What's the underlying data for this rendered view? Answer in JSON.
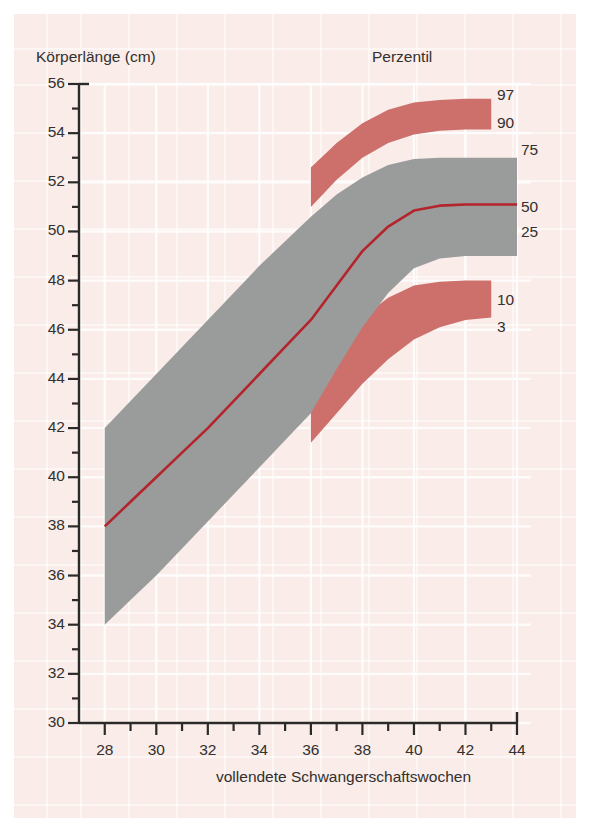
{
  "figure": {
    "y_axis_title": "Körperlänge (cm)",
    "x_axis_title": "vollendete Schwangerschaftswochen",
    "legend_title": "Perzentil",
    "background_color": "#f9ece9",
    "band_outer_color": "#cd6f6b",
    "band_inner_color": "#9a9c9c",
    "median_color": "#b4242c",
    "axis_color": "#2c2a29",
    "grid_color": "#ffffff"
  },
  "chart_data": {
    "type": "area",
    "title": "",
    "subtitle": "",
    "xlabel": "vollendete Schwangerschaftswochen",
    "ylabel": "Körperlänge (cm)",
    "xlim": [
      27,
      44
    ],
    "ylim": [
      30,
      56
    ],
    "xticks": [
      28,
      30,
      32,
      34,
      36,
      38,
      40,
      42,
      44
    ],
    "yticks": [
      30,
      32,
      34,
      36,
      38,
      40,
      42,
      44,
      46,
      48,
      50,
      52,
      54,
      56
    ],
    "xtick_minor_step": 1,
    "ytick_minor_step": 1,
    "grid": true,
    "legend_position": "right",
    "legend_title": "Perzentil",
    "legend_entries": [
      "97",
      "90",
      "75",
      "50",
      "25",
      "10",
      "3"
    ],
    "x": [
      28,
      29,
      30,
      31,
      32,
      33,
      34,
      35,
      36,
      37,
      38,
      39,
      40,
      41,
      42,
      43,
      44
    ],
    "series": [
      {
        "name": "97",
        "label": "97",
        "color": "#cd6f6b",
        "values": [
          null,
          null,
          null,
          null,
          null,
          null,
          null,
          null,
          52.6,
          53.6,
          54.4,
          54.95,
          55.25,
          55.35,
          55.4,
          55.4,
          null
        ]
      },
      {
        "name": "90",
        "label": "90",
        "color": "#cd6f6b",
        "values": [
          null,
          null,
          null,
          null,
          null,
          null,
          null,
          null,
          51.0,
          52.1,
          53.0,
          53.6,
          53.95,
          54.1,
          54.15,
          54.15,
          null
        ]
      },
      {
        "name": "75",
        "label": "75",
        "color": "#9a9c9c",
        "values": [
          42.0,
          43.1,
          44.2,
          45.3,
          46.4,
          47.5,
          48.6,
          49.6,
          50.6,
          51.5,
          52.2,
          52.7,
          52.95,
          53.0,
          53.0,
          53.0,
          53.0
        ]
      },
      {
        "name": "50",
        "label": "50",
        "color": "#b4242c",
        "values": [
          38.0,
          39.0,
          40.0,
          41.0,
          42.0,
          43.1,
          44.2,
          45.3,
          46.4,
          47.8,
          49.2,
          50.2,
          50.85,
          51.05,
          51.1,
          51.1,
          51.1
        ]
      },
      {
        "name": "25",
        "label": "25",
        "color": "#9a9c9c",
        "values": [
          34.0,
          35.0,
          36.0,
          37.1,
          38.2,
          39.3,
          40.4,
          41.5,
          42.6,
          44.4,
          46.1,
          47.5,
          48.5,
          48.9,
          49.0,
          49.0,
          49.0
        ]
      },
      {
        "name": "10",
        "label": "10",
        "color": "#cd6f6b",
        "values": [
          null,
          null,
          null,
          null,
          null,
          null,
          null,
          null,
          44.6,
          45.6,
          46.5,
          47.3,
          47.8,
          47.95,
          48.0,
          48.0,
          null
        ]
      },
      {
        "name": "3",
        "label": "3",
        "color": "#cd6f6b",
        "values": [
          null,
          null,
          null,
          null,
          null,
          null,
          null,
          null,
          41.4,
          42.6,
          43.8,
          44.8,
          45.6,
          46.1,
          46.4,
          46.5,
          null
        ]
      }
    ],
    "annotations": [
      {
        "text": "Perzentil",
        "role": "legend-title"
      },
      {
        "text": "97",
        "role": "percentile-label"
      },
      {
        "text": "90",
        "role": "percentile-label"
      },
      {
        "text": "75",
        "role": "percentile-label"
      },
      {
        "text": "50",
        "role": "percentile-label"
      },
      {
        "text": "25",
        "role": "percentile-label"
      },
      {
        "text": "10",
        "role": "percentile-label"
      },
      {
        "text": "3",
        "role": "percentile-label"
      }
    ]
  },
  "labels": {
    "percentiles": [
      {
        "text": "97",
        "x": 497,
        "y": 86
      },
      {
        "text": "90",
        "x": 497,
        "y": 114
      },
      {
        "text": "75",
        "x": 521,
        "y": 141
      },
      {
        "text": "50",
        "x": 521,
        "y": 198
      },
      {
        "text": "25",
        "x": 521,
        "y": 223
      },
      {
        "text": "10",
        "x": 497,
        "y": 291
      },
      {
        "text": "3",
        "x": 497,
        "y": 318
      }
    ]
  }
}
